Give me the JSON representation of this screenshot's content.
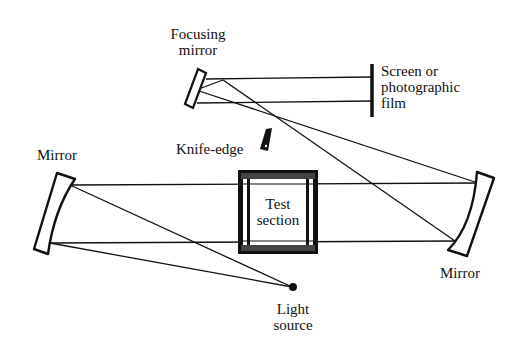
{
  "diagram": {
    "type": "Schlieren optical system",
    "colors": {
      "line": "#111111",
      "background": "#ffffff"
    },
    "labels": {
      "focusing_mirror": [
        "Focusing",
        "mirror"
      ],
      "screen": [
        "Screen or",
        "photographic",
        "film"
      ],
      "knife_edge": "Knife-edge",
      "mirror_left": "Mirror",
      "mirror_right": "Mirror",
      "test_section": [
        "Test",
        "section"
      ],
      "light_source": [
        "Light",
        "source"
      ]
    },
    "components": [
      {
        "id": "light-source",
        "kind": "point source"
      },
      {
        "id": "mirror-left",
        "kind": "concave mirror"
      },
      {
        "id": "test-section",
        "kind": "windowed chamber"
      },
      {
        "id": "mirror-right",
        "kind": "concave mirror"
      },
      {
        "id": "knife-edge",
        "kind": "knife edge"
      },
      {
        "id": "focusing-mirror",
        "kind": "flat/focusing mirror"
      },
      {
        "id": "screen",
        "kind": "screen / film"
      }
    ]
  }
}
